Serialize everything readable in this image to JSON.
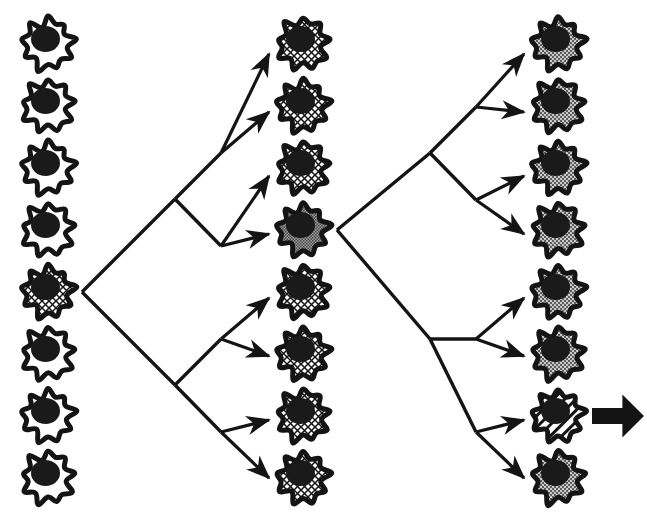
{
  "figure": {
    "caption_text": "",
    "background_color": "#ffffff",
    "ink_color": "#141414",
    "columns": [
      {
        "name": "generation-1",
        "index": 0,
        "x": 48,
        "cell_count": 8,
        "cells": [
          {
            "index": 0,
            "y": 44,
            "fill": "white",
            "label": "unselected-cell"
          },
          {
            "index": 1,
            "y": 106,
            "fill": "white",
            "label": "unselected-cell"
          },
          {
            "index": 2,
            "y": 168,
            "fill": "white",
            "label": "unselected-cell"
          },
          {
            "index": 3,
            "y": 230,
            "fill": "white",
            "label": "unselected-cell"
          },
          {
            "index": 4,
            "y": 292,
            "fill": "crosshatch",
            "label": "selected-founder-cell"
          },
          {
            "index": 5,
            "y": 354,
            "fill": "white",
            "label": "unselected-cell"
          },
          {
            "index": 6,
            "y": 416,
            "fill": "white",
            "label": "unselected-cell"
          },
          {
            "index": 7,
            "y": 478,
            "fill": "white",
            "label": "unselected-cell"
          }
        ]
      },
      {
        "name": "generation-2",
        "index": 1,
        "x": 303,
        "cell_count": 8,
        "cells": [
          {
            "index": 0,
            "y": 44,
            "fill": "crosshatch",
            "label": "clone-cell"
          },
          {
            "index": 1,
            "y": 106,
            "fill": "crosshatch",
            "label": "clone-cell"
          },
          {
            "index": 2,
            "y": 168,
            "fill": "crosshatch",
            "label": "clone-cell"
          },
          {
            "index": 3,
            "y": 230,
            "fill": "gray-dense",
            "label": "selected-founder-cell"
          },
          {
            "index": 4,
            "y": 292,
            "fill": "crosshatch",
            "label": "clone-cell"
          },
          {
            "index": 5,
            "y": 354,
            "fill": "crosshatch",
            "label": "clone-cell"
          },
          {
            "index": 6,
            "y": 416,
            "fill": "crosshatch",
            "label": "clone-cell"
          },
          {
            "index": 7,
            "y": 478,
            "fill": "crosshatch",
            "label": "clone-cell"
          }
        ]
      },
      {
        "name": "generation-3",
        "index": 2,
        "x": 558,
        "cell_count": 8,
        "cells": [
          {
            "index": 0,
            "y": 44,
            "fill": "gray-stipple",
            "label": "clone-cell"
          },
          {
            "index": 1,
            "y": 106,
            "fill": "gray-stipple",
            "label": "clone-cell"
          },
          {
            "index": 2,
            "y": 168,
            "fill": "gray-stipple",
            "label": "clone-cell"
          },
          {
            "index": 3,
            "y": 230,
            "fill": "gray-stipple",
            "label": "clone-cell"
          },
          {
            "index": 4,
            "y": 292,
            "fill": "gray-stipple",
            "label": "clone-cell"
          },
          {
            "index": 5,
            "y": 354,
            "fill": "gray-stipple",
            "label": "clone-cell"
          },
          {
            "index": 6,
            "y": 416,
            "fill": "diagonal-stripe",
            "label": "selected-output-cell"
          },
          {
            "index": 7,
            "y": 478,
            "fill": "gray-stipple",
            "label": "clone-cell"
          }
        ]
      }
    ],
    "trees": [
      {
        "name": "tree-left",
        "source": {
          "column": 0,
          "cell": 4,
          "x": 82,
          "y": 292
        },
        "node_main": {
          "x": 175,
          "y": 199
        },
        "node_upper": {
          "x": 221,
          "y": 153
        },
        "node_lower": {
          "x": 175,
          "y": 385
        },
        "node_lower_inner": {
          "x": 221,
          "y": 339
        },
        "arrow_targets": [
          {
            "from_x": 221,
            "from_y": 153,
            "to_x": 269,
            "to_y": 54,
            "cell": 0
          },
          {
            "from_x": 221,
            "from_y": 153,
            "to_x": 269,
            "to_y": 112,
            "cell": 1
          },
          {
            "from_x": 221,
            "from_y": 246,
            "to_x": 269,
            "to_y": 176,
            "cell": 2
          },
          {
            "from_x": 221,
            "from_y": 246,
            "to_x": 269,
            "to_y": 234,
            "cell": 3
          },
          {
            "from_x": 221,
            "from_y": 339,
            "to_x": 269,
            "to_y": 298,
            "cell": 4
          },
          {
            "from_x": 221,
            "from_y": 339,
            "to_x": 269,
            "to_y": 356,
            "cell": 5
          },
          {
            "from_x": 221,
            "from_y": 432,
            "to_x": 269,
            "to_y": 420,
            "cell": 6
          },
          {
            "from_x": 221,
            "from_y": 432,
            "to_x": 269,
            "to_y": 478,
            "cell": 7
          }
        ]
      },
      {
        "name": "tree-right",
        "source": {
          "column": 1,
          "cell": 3,
          "x": 337,
          "y": 230
        },
        "node_main": {
          "x": 430,
          "y": 153
        },
        "arrow_targets": [
          {
            "from_x": 476,
            "from_y": 107,
            "to_x": 524,
            "to_y": 54,
            "cell": 0
          },
          {
            "from_x": 476,
            "from_y": 107,
            "to_x": 524,
            "to_y": 112,
            "cell": 1
          },
          {
            "from_x": 476,
            "from_y": 200,
            "to_x": 524,
            "to_y": 176,
            "cell": 2
          },
          {
            "from_x": 476,
            "from_y": 200,
            "to_x": 524,
            "to_y": 234,
            "cell": 3
          },
          {
            "from_x": 476,
            "from_y": 339,
            "to_x": 524,
            "to_y": 298,
            "cell": 4
          },
          {
            "from_x": 476,
            "from_y": 339,
            "to_x": 524,
            "to_y": 356,
            "cell": 5
          },
          {
            "from_x": 476,
            "from_y": 432,
            "to_x": 524,
            "to_y": 420,
            "cell": 6
          },
          {
            "from_x": 476,
            "from_y": 432,
            "to_x": 524,
            "to_y": 478,
            "cell": 7
          }
        ]
      }
    ],
    "output_arrow": {
      "name": "bold-output-arrow",
      "x": 592,
      "y": 416,
      "length": 52,
      "thickness": 16,
      "color": "#141414"
    },
    "cell_geometry": {
      "body_radius": 27,
      "nucleus_radius": 13,
      "outline_width": 5,
      "lobes": 9
    },
    "fill_swatches": {
      "white": "#ffffff",
      "crosshatch": "#ffffff",
      "gray_dense": "#8a8a8a",
      "gray_stipple": "#a8a8a8",
      "diagonal_stripe": "#ffffff",
      "nucleus": "#1a1a1a",
      "outline": "#141414"
    }
  }
}
